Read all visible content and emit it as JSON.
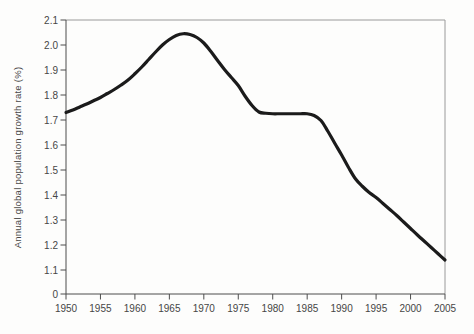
{
  "chart_data": {
    "type": "line",
    "title": "",
    "xlabel": "",
    "ylabel": "Annual global population growth rate (%)",
    "x_tick_labels": [
      "1950",
      "1955",
      "1960",
      "1965",
      "1970",
      "1975",
      "1980",
      "1985",
      "1990",
      "1995",
      "2000",
      "2005"
    ],
    "y_tick_labels": [
      "2.1",
      "2.0",
      "1.9",
      "1.8",
      "1.7",
      "1.6",
      "1.5",
      "1.4",
      "1.3",
      "1.2",
      "1.1",
      "0"
    ],
    "xlim": [
      1950,
      2005
    ],
    "ylim": [
      1.1,
      2.1
    ],
    "y_axis_note": "0 shown at axis base below a compressed gap under 1.1",
    "grid": false,
    "legend": "none",
    "frame": "full box",
    "line_color": "#1b1b1b",
    "axis_color": "#4d4d4d",
    "frame_color": "#9a9a9a",
    "text_color": "#464646",
    "series": [
      {
        "name": "World annual population growth rate (%)",
        "x": [
          1950,
          1951,
          1952,
          1953,
          1954,
          1955,
          1956,
          1957,
          1958,
          1959,
          1960,
          1961,
          1962,
          1963,
          1964,
          1965,
          1966,
          1967,
          1968,
          1969,
          1970,
          1971,
          1972,
          1973,
          1974,
          1975,
          1976,
          1977,
          1978,
          1979,
          1980,
          1981,
          1982,
          1983,
          1984,
          1985,
          1986,
          1987,
          1988,
          1989,
          1990,
          1991,
          1992,
          1993,
          1994,
          1995,
          1996,
          1997,
          1998,
          1999,
          2000,
          2001,
          2002,
          2003,
          2004,
          2005
        ],
        "y": [
          1.73,
          1.74,
          1.752,
          1.764,
          1.777,
          1.79,
          1.806,
          1.822,
          1.84,
          1.86,
          1.885,
          1.912,
          1.942,
          1.972,
          2.0,
          2.022,
          2.038,
          2.045,
          2.042,
          2.03,
          2.008,
          1.975,
          1.938,
          1.902,
          1.87,
          1.838,
          1.795,
          1.758,
          1.732,
          1.727,
          1.725,
          1.725,
          1.725,
          1.725,
          1.725,
          1.725,
          1.718,
          1.698,
          1.655,
          1.607,
          1.56,
          1.51,
          1.465,
          1.435,
          1.41,
          1.39,
          1.366,
          1.342,
          1.318,
          1.292,
          1.266,
          1.24,
          1.215,
          1.19,
          1.165,
          1.14
        ]
      }
    ]
  }
}
